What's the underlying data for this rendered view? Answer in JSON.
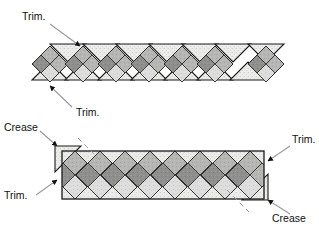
{
  "figure": {
    "type": "diagram",
    "canvas": {
      "width": 319,
      "height": 228
    },
    "background": "#ffffff"
  },
  "palette": {
    "outline": "#1a1a1a",
    "background_fabric": "#e9e9e6",
    "light_patch": "#d9d9d6",
    "mid_patch": "#b4b4b2",
    "dark_patch": "#8e8e8c",
    "leader_line": "#9a9a9a",
    "arrow": "#111111",
    "text": "#111111"
  },
  "labels": [
    {
      "id": "trim-top-left",
      "text": "Trim.",
      "x": 22,
      "y": 20,
      "anchor": "start"
    },
    {
      "id": "trim-bottom-left",
      "text": "Trim.",
      "x": 74,
      "y": 113,
      "anchor": "start"
    },
    {
      "id": "crease-left",
      "text": "Crease",
      "x": 6,
      "y": 131,
      "anchor": "start"
    },
    {
      "id": "trim-lower-left",
      "text": "Trim.",
      "x": 6,
      "y": 199,
      "anchor": "start"
    },
    {
      "id": "trim-lower-right",
      "text": "Trim.",
      "x": 277,
      "y": 141,
      "anchor": "start"
    },
    {
      "id": "crease-right",
      "text": "Crease",
      "x": 272,
      "y": 223,
      "anchor": "start"
    }
  ],
  "leaders": [
    {
      "id": "leader-trim-top-left",
      "from": [
        50,
        24
      ],
      "to": [
        82,
        47
      ],
      "arrow": "end"
    },
    {
      "id": "leader-trim-bottom-left",
      "from": [
        72,
        108
      ],
      "to": [
        50,
        85
      ],
      "arrow": "end"
    },
    {
      "id": "leader-crease-left",
      "from": [
        40,
        132
      ],
      "to": [
        57,
        146
      ],
      "arrow": "end"
    },
    {
      "id": "leader-trim-lower-left",
      "from": [
        36,
        196
      ],
      "to": [
        57,
        181
      ],
      "arrow": "end"
    },
    {
      "id": "leader-trim-lower-right",
      "from": [
        279,
        146
      ],
      "to": [
        261,
        160
      ],
      "arrow": "end"
    },
    {
      "id": "leader-crease-right",
      "from": [
        283,
        214
      ],
      "to": [
        266,
        200
      ],
      "arrow": "end"
    }
  ],
  "top_strip": {
    "name": "pieced-diamond-units-row",
    "unit_count": 7,
    "description": "Row of seven sewn diamond-in-trapezoid units, alternating triangle orientation",
    "origin": [
      30,
      44
    ],
    "unit_width": 37,
    "unit_height": 43,
    "patch_layout": {
      "rows": 2,
      "cols": 2,
      "shades": [
        "dark_patch",
        "mid_patch",
        "mid_patch",
        "light_patch"
      ]
    }
  },
  "bottom_strip": {
    "name": "assembled-border-strip",
    "description": "Finished straight border strip with on-point diamond chain and crease triangles at both ends",
    "rect": {
      "x": 62,
      "y": 151,
      "width": 202,
      "height": 48
    },
    "diamond_count": 8,
    "end_triangles": [
      {
        "id": "crease-triangle-left",
        "points": "55,146 80,146 55,173"
      },
      {
        "id": "crease-triangle-right",
        "points": "268,173 268,200 243,200"
      }
    ]
  }
}
